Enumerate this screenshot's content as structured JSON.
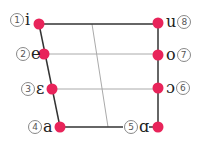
{
  "colors": {
    "dot": "#e8245a",
    "outline": "#333333",
    "grid": "#aaaaaa"
  },
  "vowels": [
    {
      "num": "1",
      "symbol": "i",
      "position": "front close"
    },
    {
      "num": "2",
      "symbol": "e",
      "position": "front close-mid"
    },
    {
      "num": "3",
      "symbol": "ɛ",
      "position": "front open-mid"
    },
    {
      "num": "4",
      "symbol": "a",
      "position": "front open"
    },
    {
      "num": "5",
      "symbol": "ɑ",
      "position": "back open"
    },
    {
      "num": "6",
      "symbol": "ɔ",
      "position": "back open-mid"
    },
    {
      "num": "7",
      "symbol": "o",
      "position": "back close-mid"
    },
    {
      "num": "8",
      "symbol": "u",
      "position": "back close"
    }
  ]
}
